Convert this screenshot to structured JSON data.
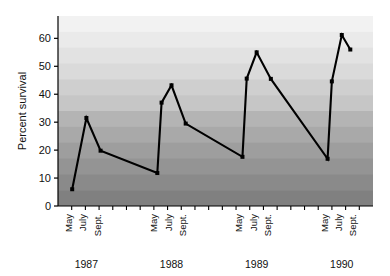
{
  "chart_data": {
    "type": "line",
    "title": "",
    "subtitle": "",
    "xlabel": "",
    "ylabel": "Percent survival",
    "ylim": [
      0,
      68
    ],
    "yticks": [
      0,
      10,
      20,
      30,
      40,
      50,
      60
    ],
    "ytick_labels": [
      "0",
      "10",
      "20",
      "30",
      "40",
      "50",
      "60"
    ],
    "grid": false,
    "legend": null,
    "legend_position": "none",
    "background": "horizontal grey gradient bands, darkest at bottom",
    "x_group_labels": [
      "1987",
      "1988",
      "1989",
      "1990"
    ],
    "x_month_labels": [
      "May",
      "July",
      "Sept."
    ],
    "marker": "filled-square",
    "line_color": "#000000",
    "series": [
      {
        "name": "Percent survival",
        "points": [
          {
            "year": "1987",
            "month": "May",
            "x": 1,
            "y": 6.0
          },
          {
            "year": "1987",
            "month": "July",
            "x": 2,
            "y": 31.5
          },
          {
            "year": "1987",
            "month": "Sept.",
            "x": 3,
            "y": 19.8
          },
          {
            "year": "1988",
            "month": "May",
            "x": 7,
            "y": 11.8
          },
          {
            "year": "1988",
            "month": "May",
            "x": 7.3,
            "y": 37.0
          },
          {
            "year": "1988",
            "month": "July",
            "x": 8,
            "y": 43.2
          },
          {
            "year": "1988",
            "month": "Sept.",
            "x": 9,
            "y": 29.5
          },
          {
            "year": "1989",
            "month": "May",
            "x": 13,
            "y": 17.6
          },
          {
            "year": "1989",
            "month": "May",
            "x": 13.3,
            "y": 45.6
          },
          {
            "year": "1989",
            "month": "July",
            "x": 14,
            "y": 55.0
          },
          {
            "year": "1989",
            "month": "Sept.",
            "x": 15,
            "y": 45.5
          },
          {
            "year": "1990",
            "month": "May",
            "x": 19,
            "y": 16.9
          },
          {
            "year": "1990",
            "month": "May",
            "x": 19.3,
            "y": 44.6
          },
          {
            "year": "1990",
            "month": "July",
            "x": 20,
            "y": 61.2
          },
          {
            "year": "1990",
            "month": "Sept.",
            "x": 20.6,
            "y": 56.0
          }
        ]
      }
    ],
    "band_colors": [
      "#f2f2f2",
      "#eaeaea",
      "#e2e2e2",
      "#dadada",
      "#cfcfcf",
      "#c6c6c6",
      "#b4b4b4",
      "#a9a9a9",
      "#9e9e9e",
      "#949494",
      "#8a8a8a",
      "#808080"
    ]
  },
  "axis": {
    "y_title": "Percent survival",
    "y_ticks": [
      "60",
      "50",
      "40",
      "30",
      "20",
      "10",
      "0"
    ],
    "groups": [
      {
        "year": "1987",
        "months": [
          "May",
          "July",
          "Sept."
        ]
      },
      {
        "year": "1988",
        "months": [
          "May",
          "July",
          "Sept."
        ]
      },
      {
        "year": "1989",
        "months": [
          "May",
          "July",
          "Sept."
        ]
      },
      {
        "year": "1990",
        "months": [
          "May",
          "July",
          "Sept."
        ]
      }
    ]
  }
}
